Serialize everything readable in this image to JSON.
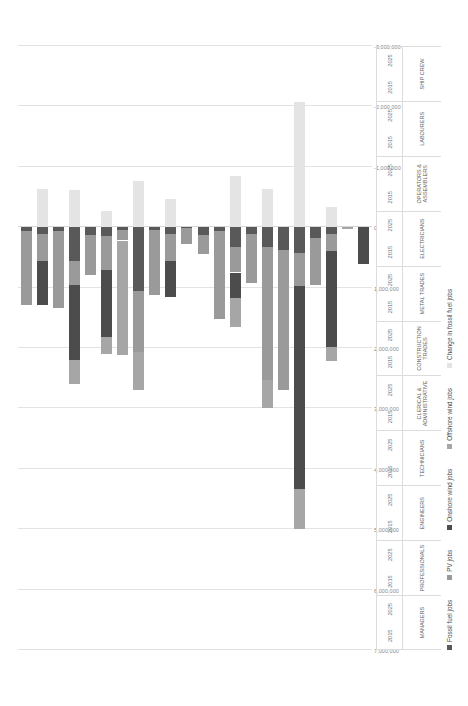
{
  "chart_data": {
    "type": "bar",
    "title": "",
    "subtitle": "",
    "xlabel": "",
    "ylabel": "",
    "orientation": "horizontal-stacked-rotated",
    "grid": true,
    "legend_position": "bottom",
    "axis": {
      "min": -3000000,
      "max": 7000000,
      "step": 1000000,
      "tick_labels": [
        "7,000,000",
        "6,000,000",
        "5,000,000",
        "4,000,000",
        "3,000,000",
        "2,000,000",
        "1,000,000",
        "0",
        "-1,000,000",
        "-2,000,000",
        "-3,000,000"
      ],
      "tick_values": [
        7000000,
        6000000,
        5000000,
        4000000,
        3000000,
        2000000,
        1000000,
        0,
        -1000000,
        -2000000,
        -3000000
      ]
    },
    "series": [
      {
        "name": "Fossil fuel jobs",
        "color": "#595959"
      },
      {
        "name": "PV jobs",
        "color": "#9a9a9a"
      },
      {
        "name": "Onshore wind jobs",
        "color": "#4c4c4c"
      },
      {
        "name": "Offshore wind jobs",
        "color": "#a6a6a6"
      },
      {
        "name": "Change in fossil fuel jobs",
        "color": "#e4e4e4"
      }
    ],
    "categories": [
      {
        "occupation": "MANAGERS",
        "years": [
          "2015",
          "2025"
        ]
      },
      {
        "occupation": "PROFESSIONALS",
        "years": [
          "2015",
          "2025"
        ]
      },
      {
        "occupation": "ENGINEERS",
        "years": [
          "2015",
          "2025"
        ]
      },
      {
        "occupation": "TECHNICIANS",
        "years": [
          "2015",
          "2025"
        ]
      },
      {
        "occupation": "CLERICAL & ADMINISTRATIVE",
        "years": [
          "2015",
          "2025"
        ]
      },
      {
        "occupation": "CONSTRUCTION TRADES",
        "years": [
          "2015",
          "2025"
        ]
      },
      {
        "occupation": "METAL TRADES",
        "years": [
          "2015",
          "2025"
        ]
      },
      {
        "occupation": "ELECTRICIANS",
        "years": [
          "2015",
          "2025"
        ]
      },
      {
        "occupation": "OPERATORS & ASSEMBLERS",
        "years": [
          "2015",
          "2025"
        ]
      },
      {
        "occupation": "LABOURERS",
        "years": [
          "2015",
          "2025"
        ]
      },
      {
        "occupation": "SHIP CREW",
        "years": [
          "2015",
          "2025"
        ]
      }
    ],
    "bars": [
      {
        "occupation": "MANAGERS",
        "year": "2015",
        "values": {
          "fossil": 60000,
          "pv": 1230000,
          "onshore": 0,
          "offshore": 0,
          "change": 0
        }
      },
      {
        "occupation": "MANAGERS",
        "year": "2025",
        "values": {
          "fossil": 120000,
          "pv": 440000,
          "onshore": 730000,
          "offshore": 0,
          "change": -630000
        }
      },
      {
        "occupation": "PROFESSIONALS",
        "year": "2015",
        "values": {
          "fossil": 70000,
          "pv": 1260000,
          "onshore": 0,
          "offshore": 0,
          "change": 0
        }
      },
      {
        "occupation": "PROFESSIONALS",
        "year": "2025",
        "values": {
          "fossil": 560000,
          "pv": 400000,
          "onshore": 1240000,
          "offshore": 400000,
          "change": -610000
        }
      },
      {
        "occupation": "ENGINEERS",
        "year": "2015",
        "values": {
          "fossil": 130000,
          "pv": 660000,
          "onshore": 0,
          "offshore": 0,
          "change": 0
        }
      },
      {
        "occupation": "ENGINEERS",
        "year": "2025",
        "values": {
          "fossil": 150000,
          "pv": 560000,
          "onshore": 1100000,
          "offshore": 290000,
          "change": -260000
        }
      },
      {
        "occupation": "TECHNICIANS",
        "year": "2015",
        "values": {
          "fossil": 50000,
          "pv": 170000,
          "onshore": 0,
          "offshore": 1890000,
          "change": 0
        }
      },
      {
        "occupation": "TECHNICIANS",
        "year": "2025",
        "values": {
          "fossil": 1050000,
          "pv": 1020000,
          "onshore": 0,
          "offshore": 620000,
          "change": -760000
        }
      },
      {
        "occupation": "CLERICAL & ADMINISTRATIVE",
        "year": "2015",
        "values": {
          "fossil": 40000,
          "pv": 1080000,
          "onshore": 0,
          "offshore": 0,
          "change": 0
        }
      },
      {
        "occupation": "CLERICAL & ADMINISTRATIVE",
        "year": "2025",
        "values": {
          "fossil": 110000,
          "pv": 450000,
          "onshore": 600000,
          "offshore": 0,
          "change": -470000
        }
      },
      {
        "occupation": "CONSTRUCTION TRADES",
        "year": "2015",
        "values": {
          "fossil": 20000,
          "pv": 260000,
          "onshore": 0,
          "offshore": 0,
          "change": 0
        }
      },
      {
        "occupation": "CONSTRUCTION TRADES",
        "year": "2025",
        "values": {
          "fossil": 130000,
          "pv": 320000,
          "onshore": 0,
          "offshore": 0,
          "change": 0
        }
      },
      {
        "occupation": "METAL TRADES",
        "year": "2015",
        "values": {
          "fossil": 70000,
          "pv": 1450000,
          "onshore": 0,
          "offshore": 0,
          "change": 0
        }
      },
      {
        "occupation": "METAL TRADES",
        "year": "2025",
        "values": {
          "fossil": 330000,
          "pv": 420000,
          "onshore": 430000,
          "offshore": 470000,
          "change": -840000
        }
      },
      {
        "occupation": "ELECTRICIANS",
        "year": "2015",
        "values": {
          "fossil": 120000,
          "pv": 800000,
          "onshore": 0,
          "offshore": 0,
          "change": 0
        }
      },
      {
        "occupation": "ELECTRICIANS",
        "year": "2025",
        "values": {
          "fossil": 330000,
          "pv": 2200000,
          "onshore": 0,
          "offshore": 460000,
          "change": -630000
        }
      },
      {
        "occupation": "OPERATORS & ASSEMBLERS",
        "year": "2015",
        "values": {
          "fossil": 380000,
          "pv": 2310000,
          "onshore": 0,
          "offshore": 0,
          "change": 0
        }
      },
      {
        "occupation": "OPERATORS & ASSEMBLERS",
        "year": "2025",
        "values": {
          "fossil": 420000,
          "pv": 550000,
          "onshore": 3360000,
          "offshore": 670000,
          "change": -2080000
        }
      },
      {
        "occupation": "LABOURERS",
        "year": "2015",
        "values": {
          "fossil": 180000,
          "pv": 780000,
          "onshore": 0,
          "offshore": 0,
          "change": 0
        }
      },
      {
        "occupation": "LABOURERS",
        "year": "2025",
        "values": {
          "fossil": 110000,
          "pv": 290000,
          "onshore": 1590000,
          "offshore": 230000,
          "change": -330000
        }
      },
      {
        "occupation": "SHIP CREW",
        "year": "2015",
        "values": {
          "fossil": 0,
          "pv": 0,
          "onshore": 0,
          "offshore": 30000,
          "change": 0
        }
      },
      {
        "occupation": "SHIP CREW",
        "year": "2025",
        "values": {
          "fossil": 0,
          "pv": 0,
          "onshore": 610000,
          "offshore": 0,
          "change": 0
        }
      }
    ]
  }
}
